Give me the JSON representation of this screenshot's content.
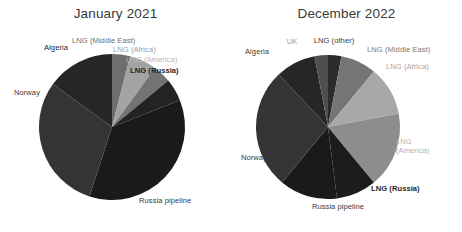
{
  "figure": {
    "background": "#ffffff",
    "width": 462,
    "height": 232
  },
  "panels": [
    {
      "id": "january-2021",
      "title": "January 2021",
      "center": [
        112,
        127
      ],
      "radius": 73
    },
    {
      "id": "december-2022",
      "title": "December 2022",
      "center": [
        97,
        127
      ],
      "radius": 72
    }
  ],
  "chart_data": [
    {
      "type": "pie",
      "title": "January 2021",
      "xlabel": "",
      "ylabel": "",
      "start_angle_deg": 0,
      "direction": "clockwise",
      "labels_inside": false,
      "legend": "none",
      "grid": false,
      "categories": [
        "LNG (Middle East)",
        "LNG (Africa)",
        "LNG (America)",
        "LNG (Russia)",
        "Russia pipeline",
        "Norway",
        "Algeria"
      ],
      "values": [
        4,
        6,
        4,
        5,
        36,
        30,
        15
      ],
      "colors": [
        "#6e6e6e",
        "#a3a3a3",
        "#747474",
        "#232323",
        "#1a1a1a",
        "#343434",
        "#262626"
      ],
      "label_colors": [
        "#6f6f6f",
        "#a0a0a0",
        "#b4b4b4",
        "#1f1f1f",
        "#3a3a3a",
        "#3a3a3a",
        "#262626"
      ]
    },
    {
      "type": "pie",
      "title": "December 2022",
      "xlabel": "",
      "ylabel": "",
      "start_angle_deg": 0,
      "direction": "clockwise",
      "labels_inside": false,
      "legend": "none",
      "grid": false,
      "categories": [
        "LNG (other)",
        "LNG (Middle East)",
        "LNG (Africa)",
        "LNG (America)",
        "LNG (Russia)",
        "Russia pipeline",
        "Norway",
        "Algeria",
        "UK"
      ],
      "values": [
        3,
        8,
        11,
        17,
        9,
        13,
        27,
        9,
        3
      ],
      "colors": [
        "#2b2b2b",
        "#757575",
        "#a8a8a8",
        "#8d8d8d",
        "#1c1c1c",
        "#1a1a1a",
        "#343434",
        "#262626",
        "#4f4f4f"
      ],
      "label_colors": [
        "#3a3a3a",
        "#7b7b7b",
        "#a6a6a6",
        "#b2b2b2",
        "#1f1f1f",
        "#3a3a3a",
        "#3a3a3a",
        "#3a3a3a",
        "#9a9a9a"
      ]
    }
  ],
  "labels": {
    "january": {
      "lng_middle_east": "LNG (Middle East)",
      "lng_africa": "LNG (Africa)",
      "lng_america": "LNG (America)",
      "lng_russia": "LNG (Russia)",
      "russia_pipeline": "Russia pipeline",
      "norway": "Norway",
      "algeria": "Algeria"
    },
    "december": {
      "lng_other": "LNG (other)",
      "lng_middle_east": "LNG (Middle East)",
      "lng_africa": "LNG (Africa)",
      "lng_america": "LNG (America)",
      "lng_russia": "LNG (Russia)",
      "russia_pipeline": "Russia pipeline",
      "norway": "Norway",
      "algeria": "Algeria",
      "uk": "UK"
    }
  }
}
